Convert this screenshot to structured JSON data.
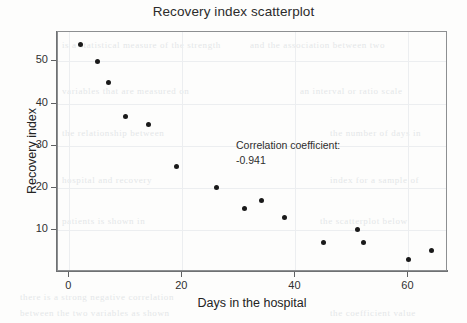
{
  "chart_data": {
    "type": "scatter",
    "title": "Recovery index scatterplot",
    "xlabel": "Days in the hospital",
    "ylabel": "Recovery index",
    "xlim": [
      -2,
      67
    ],
    "ylim": [
      0,
      57
    ],
    "xticks": [
      0,
      20,
      40,
      60
    ],
    "yticks": [
      10,
      20,
      30,
      40,
      50
    ],
    "grid": true,
    "legend": null,
    "marker": "filled-circle",
    "marker_color": "#1a1a1a",
    "annotations": [
      {
        "line1": "Correlation coefficient:",
        "line2": "-0.941"
      }
    ],
    "correlation_coefficient": -0.941,
    "x": [
      2,
      5,
      7,
      10,
      14,
      19,
      26,
      31,
      34,
      38,
      45,
      51,
      52,
      60,
      64
    ],
    "y": [
      54,
      50,
      45,
      37,
      35,
      25,
      20,
      15,
      17,
      13,
      7,
      10,
      7,
      3,
      5
    ],
    "points": [
      {
        "x": 2,
        "y": 54
      },
      {
        "x": 5,
        "y": 50
      },
      {
        "x": 7,
        "y": 45
      },
      {
        "x": 10,
        "y": 37
      },
      {
        "x": 14,
        "y": 35
      },
      {
        "x": 19,
        "y": 25
      },
      {
        "x": 26,
        "y": 20
      },
      {
        "x": 31,
        "y": 15
      },
      {
        "x": 34,
        "y": 17
      },
      {
        "x": 38,
        "y": 13
      },
      {
        "x": 45,
        "y": 7
      },
      {
        "x": 51,
        "y": 10
      },
      {
        "x": 52,
        "y": 7
      },
      {
        "x": 60,
        "y": 3
      },
      {
        "x": 64,
        "y": 5
      }
    ]
  },
  "background_artifacts": [
    {
      "text": "is a statistical measure of the strength",
      "x": 62,
      "y": 40
    },
    {
      "text": "and the association between two",
      "x": 250,
      "y": 40
    },
    {
      "text": "variables that are measured on",
      "x": 62,
      "y": 86
    },
    {
      "text": "an interval or ratio scale",
      "x": 300,
      "y": 86
    },
    {
      "text": "the relationship between",
      "x": 62,
      "y": 128
    },
    {
      "text": "the number of days in",
      "x": 330,
      "y": 128
    },
    {
      "text": "hospital and recovery",
      "x": 62,
      "y": 175
    },
    {
      "text": "index for a sample of",
      "x": 330,
      "y": 175
    },
    {
      "text": "patients is shown in",
      "x": 62,
      "y": 216
    },
    {
      "text": "the scatterplot below",
      "x": 320,
      "y": 216
    },
    {
      "text": "there is a strong negative correlation",
      "x": 20,
      "y": 292
    },
    {
      "text": "between the two variables as shown",
      "x": 20,
      "y": 308
    },
    {
      "text": "the coefficient value",
      "x": 330,
      "y": 308
    }
  ]
}
